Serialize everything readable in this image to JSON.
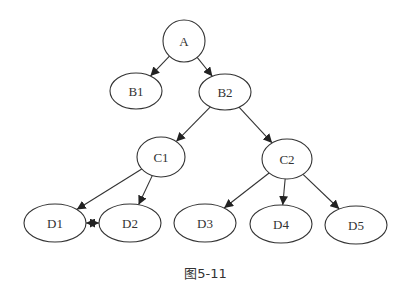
{
  "diagram": {
    "type": "directed-graph",
    "nodes": [
      {
        "id": "A",
        "label": "A",
        "cx": 184,
        "cy": 41,
        "rx": 21,
        "ry": 21
      },
      {
        "id": "B1",
        "label": "B1",
        "cx": 136,
        "cy": 91,
        "rx": 26,
        "ry": 18
      },
      {
        "id": "B2",
        "label": "B2",
        "cx": 225,
        "cy": 92,
        "rx": 26,
        "ry": 18
      },
      {
        "id": "C1",
        "label": "C1",
        "cx": 161,
        "cy": 157,
        "rx": 24,
        "ry": 20
      },
      {
        "id": "C2",
        "label": "C2",
        "cx": 287,
        "cy": 159,
        "rx": 25,
        "ry": 20
      },
      {
        "id": "D1",
        "label": "D1",
        "cx": 55,
        "cy": 223,
        "rx": 31,
        "ry": 19
      },
      {
        "id": "D2",
        "label": "D2",
        "cx": 130,
        "cy": 223,
        "rx": 31,
        "ry": 19
      },
      {
        "id": "D3",
        "label": "D3",
        "cx": 205,
        "cy": 223,
        "rx": 31,
        "ry": 19
      },
      {
        "id": "D4",
        "label": "D4",
        "cx": 281,
        "cy": 224,
        "rx": 31,
        "ry": 19
      },
      {
        "id": "D5",
        "label": "D5",
        "cx": 356,
        "cy": 225,
        "rx": 31,
        "ry": 19
      }
    ],
    "edges": [
      {
        "from": "A",
        "to": "B1"
      },
      {
        "from": "A",
        "to": "B2"
      },
      {
        "from": "B2",
        "to": "C1"
      },
      {
        "from": "B2",
        "to": "C2"
      },
      {
        "from": "C1",
        "to": "D1"
      },
      {
        "from": "C1",
        "to": "D2"
      },
      {
        "from": "C2",
        "to": "D3"
      },
      {
        "from": "C2",
        "to": "D4"
      },
      {
        "from": "C2",
        "to": "D5"
      },
      {
        "from": "D1",
        "to": "D2",
        "bidirectional": true
      }
    ]
  },
  "caption": "图5-11"
}
